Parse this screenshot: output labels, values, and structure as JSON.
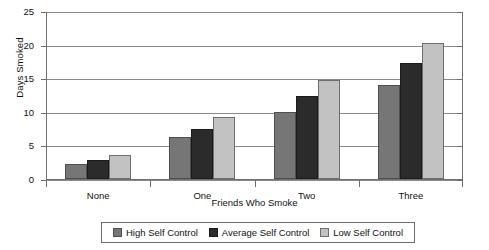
{
  "chart_data": {
    "type": "bar",
    "title": "",
    "xlabel": "Friends Who Smoke",
    "ylabel": "Days Smoked",
    "categories": [
      "None",
      "One",
      "Two",
      "Three"
    ],
    "series": [
      {
        "name": "High Self Control",
        "color": "#767676",
        "values": [
          2.3,
          6.2,
          10.0,
          14.0
        ]
      },
      {
        "name": "Average Self Control",
        "color": "#2b2b2b",
        "values": [
          2.9,
          7.5,
          12.3,
          17.2
        ]
      },
      {
        "name": "Low Self Control",
        "color": "#c2c2c2",
        "values": [
          3.6,
          9.2,
          14.8,
          20.2
        ]
      }
    ],
    "ylim": [
      0,
      25
    ],
    "yticks": [
      0,
      5,
      10,
      15,
      20,
      25
    ],
    "ytick_labels": [
      "0",
      "5",
      "10",
      "15",
      "20",
      "25"
    ],
    "grid": true,
    "legend_position": "bottom"
  }
}
